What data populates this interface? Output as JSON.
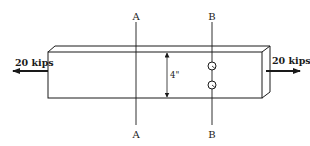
{
  "diagram": {
    "type": "tension-member-with-holes",
    "section_labels": {
      "a_top": "A",
      "a_bottom": "A",
      "b_top": "B",
      "b_bottom": "B"
    },
    "loads": {
      "left": "20 kips",
      "right": "20 kips"
    },
    "dimension": {
      "width": "4\""
    },
    "holes_count": 2,
    "colors": {
      "stroke": "#1a1a1a",
      "background": "#ffffff"
    }
  }
}
